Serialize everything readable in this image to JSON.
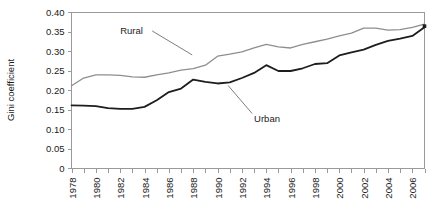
{
  "chart_data": {
    "type": "line",
    "title": "",
    "xlabel": "",
    "ylabel": "Gini coefficient",
    "ylim": [
      0,
      0.4
    ],
    "ytick_labels": [
      "0",
      "0.05",
      "0.10",
      "0.15",
      "0.20",
      "0.25",
      "0.30",
      "0.35",
      "0.40"
    ],
    "ytick_values": [
      0,
      0.05,
      0.1,
      0.15,
      0.2,
      0.25,
      0.3,
      0.35,
      0.4
    ],
    "xtick_labels": [
      "1978",
      "1980",
      "1982",
      "1984",
      "1986",
      "1988",
      "1990",
      "1992",
      "1994",
      "1996",
      "1998",
      "2000",
      "2002",
      "2004",
      "2006"
    ],
    "x": [
      1978,
      1979,
      1980,
      1981,
      1982,
      1983,
      1984,
      1985,
      1986,
      1987,
      1988,
      1989,
      1990,
      1991,
      1992,
      1993,
      1994,
      1995,
      1996,
      1997,
      1998,
      1999,
      2000,
      2001,
      2002,
      2003,
      2004,
      2005,
      2006,
      2007
    ],
    "xlim": [
      1978,
      2007
    ],
    "grid": false,
    "legend_position": "inline-annotations",
    "series": [
      {
        "name": "Rural",
        "color": "#8e8e8e",
        "values": [
          0.212,
          0.232,
          0.24,
          0.24,
          0.239,
          0.235,
          0.234,
          0.24,
          0.245,
          0.252,
          0.256,
          0.265,
          0.288,
          0.293,
          0.299,
          0.309,
          0.318,
          0.312,
          0.309,
          0.318,
          0.325,
          0.332,
          0.34,
          0.347,
          0.36,
          0.36,
          0.355,
          0.356,
          0.362,
          0.37
        ]
      },
      {
        "name": "Urban",
        "color": "#1d1d1d",
        "values": [
          0.162,
          0.161,
          0.16,
          0.155,
          0.153,
          0.153,
          0.158,
          0.175,
          0.196,
          0.205,
          0.228,
          0.222,
          0.218,
          0.221,
          0.232,
          0.245,
          0.265,
          0.25,
          0.25,
          0.257,
          0.268,
          0.27,
          0.29,
          0.298,
          0.305,
          0.317,
          0.327,
          0.333,
          0.34,
          0.362
        ]
      }
    ],
    "annotations": [
      {
        "text": "Rural",
        "x": 1982,
        "y": 0.345
      },
      {
        "text": "Urban",
        "x": 1993,
        "y": 0.118
      }
    ],
    "end_marker": {
      "series": "Urban",
      "x": 2007,
      "y": 0.365
    }
  }
}
